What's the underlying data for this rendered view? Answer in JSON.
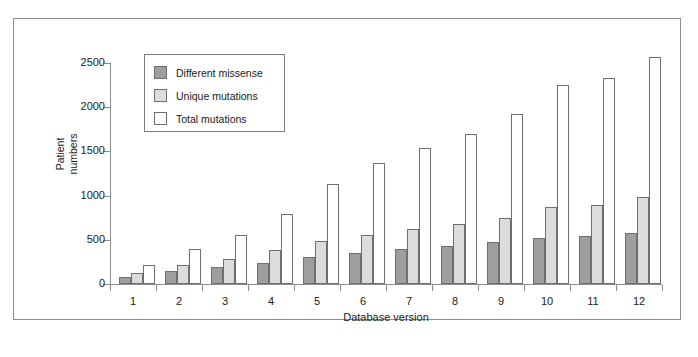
{
  "chart_data": {
    "type": "bar",
    "title": "",
    "xlabel": "Database version",
    "ylabel": "Patient numbers",
    "categories": [
      "1",
      "2",
      "3",
      "4",
      "5",
      "6",
      "7",
      "8",
      "9",
      "10",
      "11",
      "12"
    ],
    "ylim": [
      0,
      2500
    ],
    "yticks": [
      0,
      500,
      1000,
      1500,
      2000,
      2500
    ],
    "ytick_labels": [
      "0",
      "500",
      "1000",
      "1500",
      "2000",
      "2500"
    ],
    "grid": false,
    "legend_position": "upper-left-inside",
    "series": [
      {
        "name": "Different missense",
        "color": "#9e9e9e",
        "values": [
          80,
          150,
          190,
          240,
          300,
          350,
          395,
          425,
          470,
          525,
          540,
          580
        ]
      },
      {
        "name": "Unique mutations",
        "color": "#dcdcdc",
        "values": [
          120,
          215,
          285,
          390,
          490,
          560,
          620,
          675,
          745,
          875,
          890,
          980
        ]
      },
      {
        "name": "Total mutations",
        "color": "#ffffff",
        "values": [
          210,
          395,
          555,
          790,
          1130,
          1370,
          1535,
          1700,
          1920,
          2250,
          2325,
          2565
        ]
      }
    ]
  },
  "figure": {
    "frame_color": "#8d8d8d",
    "axis_color": "#8d8d8d",
    "bar_outline_color": "#6f6f6f",
    "background": "#ffffff"
  }
}
